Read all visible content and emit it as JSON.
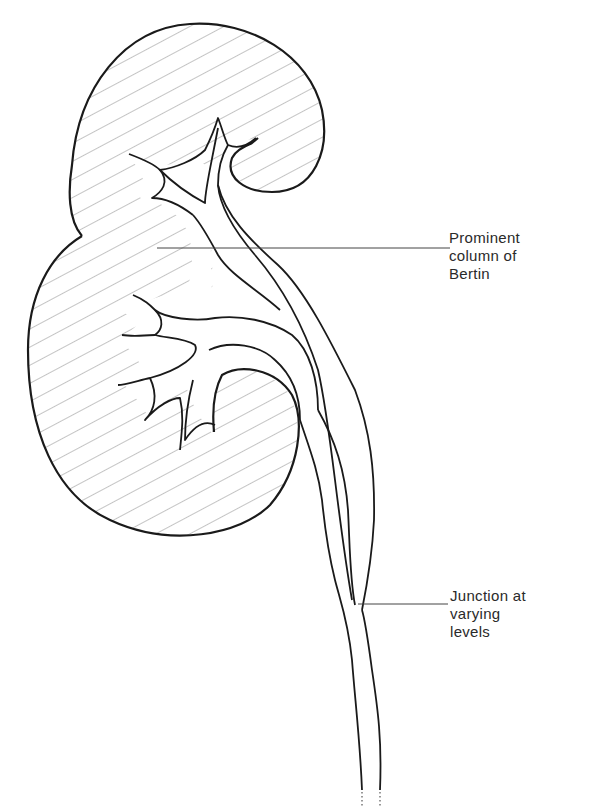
{
  "diagram": {
    "colors": {
      "outline": "#1a1a1a",
      "hatch": "#8a8a8a",
      "leader": "#444444",
      "background": "#ffffff",
      "text": "#2a2a2a"
    },
    "labels": [
      {
        "id": "column-of-bertin",
        "lines": [
          "Prominent",
          "column of",
          "Bertin"
        ]
      },
      {
        "id": "junction",
        "lines": [
          "Junction at",
          "varying",
          "levels"
        ]
      }
    ]
  }
}
